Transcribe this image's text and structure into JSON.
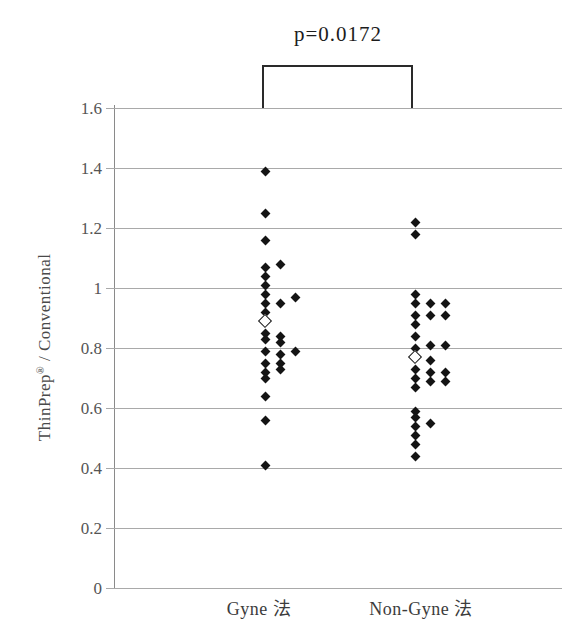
{
  "figure": {
    "p_label": "p=0.0172",
    "y_axis_title": {
      "pre": "ThinPrep",
      "sup": "®",
      "post": " / Conventional"
    }
  },
  "colors": {
    "background": "#ffffff",
    "marker": "#141414",
    "grid": "#a9a9a9",
    "axis": "#8a8a8a",
    "tick_text": "#555555",
    "bracket": "#2a2a2a"
  },
  "chart_data": {
    "type": "scatter",
    "title": "",
    "xlabel": "",
    "ylabel": "ThinPrep® / Conventional",
    "annotation": "p=0.0172",
    "ylim": [
      0,
      1.6
    ],
    "ytick_labels": [
      "0",
      "0.2",
      "0.4",
      "0.6",
      "0.8",
      "1",
      "1.2",
      "1.4",
      "1.6"
    ],
    "grid": true,
    "legend": "none",
    "marker_shape": "diamond",
    "groups": [
      {
        "label": "Gyne 法",
        "points": [
          [
            0,
            1.39
          ],
          [
            0,
            1.25
          ],
          [
            0,
            1.16
          ],
          [
            0,
            1.07
          ],
          [
            1,
            1.08
          ],
          [
            0,
            1.04
          ],
          [
            0,
            1.01
          ],
          [
            0,
            0.98
          ],
          [
            0,
            0.95
          ],
          [
            1,
            0.95
          ],
          [
            2,
            0.97
          ],
          [
            0,
            0.92
          ],
          [
            0,
            0.85
          ],
          [
            1,
            0.84
          ],
          [
            0,
            0.83
          ],
          [
            1,
            0.82
          ],
          [
            0,
            0.79
          ],
          [
            1,
            0.78
          ],
          [
            2,
            0.79
          ],
          [
            0,
            0.75
          ],
          [
            1,
            0.75
          ],
          [
            0,
            0.72
          ],
          [
            1,
            0.73
          ],
          [
            0,
            0.7
          ],
          [
            0,
            0.64
          ],
          [
            0,
            0.56
          ],
          [
            0,
            0.41
          ]
        ],
        "open_point": [
          0,
          0.89
        ]
      },
      {
        "label": "Non-Gyne 法",
        "points": [
          [
            0,
            1.22
          ],
          [
            0,
            1.18
          ],
          [
            0,
            0.98
          ],
          [
            0,
            0.95
          ],
          [
            1,
            0.95
          ],
          [
            2,
            0.95
          ],
          [
            0,
            0.91
          ],
          [
            1,
            0.91
          ],
          [
            2,
            0.91
          ],
          [
            0,
            0.88
          ],
          [
            0,
            0.84
          ],
          [
            0,
            0.8
          ],
          [
            1,
            0.81
          ],
          [
            2,
            0.81
          ],
          [
            1,
            0.76
          ],
          [
            0,
            0.73
          ],
          [
            1,
            0.72
          ],
          [
            2,
            0.72
          ],
          [
            0,
            0.7
          ],
          [
            1,
            0.69
          ],
          [
            2,
            0.69
          ],
          [
            0,
            0.67
          ],
          [
            0,
            0.59
          ],
          [
            0,
            0.57
          ],
          [
            1,
            0.55
          ],
          [
            0,
            0.54
          ],
          [
            0,
            0.51
          ],
          [
            0,
            0.48
          ],
          [
            0,
            0.44
          ]
        ],
        "open_point": [
          0,
          0.77
        ]
      }
    ]
  }
}
